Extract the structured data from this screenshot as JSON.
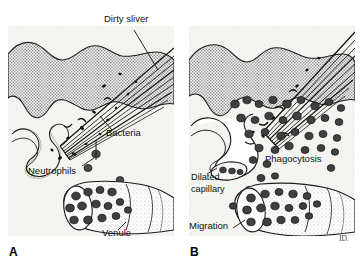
{
  "figure": {
    "background_color": "#ffffff",
    "signature": "ID."
  },
  "panels": [
    {
      "id": "A",
      "letter": "A",
      "caption": "Initial injury: dirty sliver introduces bacteria; neutrophils marginate within the venule",
      "labels": [
        {
          "name": "dirty-sliver",
          "text": "Dirty sliver",
          "x": 96,
          "y": 14,
          "anchor": "start"
        },
        {
          "name": "bacteria",
          "text": "Bacteria",
          "x": 98,
          "y": 128,
          "anchor": "start"
        },
        {
          "name": "neutrophils",
          "text": "Neutrophils",
          "x": 26,
          "y": 165,
          "anchor": "start"
        },
        {
          "name": "venule",
          "text": "Venule",
          "x": 96,
          "y": 228,
          "anchor": "start"
        }
      ]
    },
    {
      "id": "B",
      "letter": "B",
      "caption": "Established inflammation: capillary dilation, neutrophil migration and phagocytosis of bacteria",
      "labels": [
        {
          "name": "phagocytosis",
          "text": "Phagocytosis",
          "x": 78,
          "y": 152,
          "anchor": "start"
        },
        {
          "name": "dilated",
          "text": "Dilated",
          "x": 6,
          "y": 170,
          "anchor": "start"
        },
        {
          "name": "capillary",
          "text": "capillary",
          "x": 6,
          "y": 182,
          "anchor": "start"
        },
        {
          "name": "migration",
          "text": "Migration",
          "x": 4,
          "y": 219,
          "anchor": "start"
        }
      ]
    }
  ],
  "colors": {
    "epidermis_fill": "#a8a8a8",
    "dermis_fill": "#f2f2ee",
    "cell_fill": "#4a4a4a",
    "outline": "#1a1a1a",
    "label_text": "#111111",
    "background": "#ffffff"
  },
  "legend_terms": {
    "dirty_sliver": "Dirty sliver",
    "bacteria": "Bacteria",
    "neutrophils": "Neutrophils",
    "venule": "Venule",
    "phagocytosis": "Phagocytosis",
    "dilated_capillary": "Dilated capillary",
    "migration": "Migration"
  }
}
